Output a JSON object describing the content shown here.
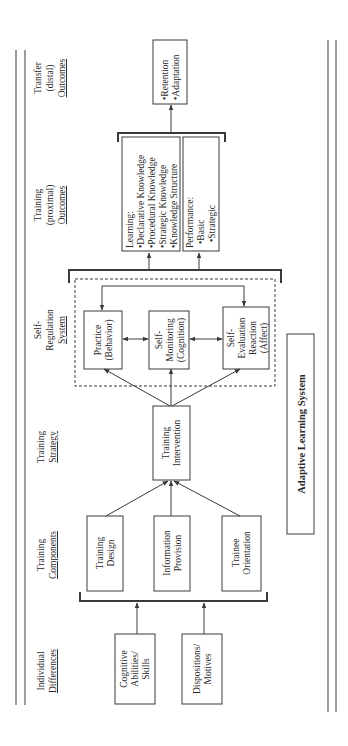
{
  "title": "Adaptive Learning System",
  "columns": {
    "individual_differences": [
      "Individual",
      "Differences"
    ],
    "training_components": [
      "Training",
      "Components"
    ],
    "training_strategy": [
      "Training",
      "Strategy"
    ],
    "self_regulation_system": [
      "Self-",
      "Regulation",
      "System"
    ],
    "training_proximal_outcomes": [
      "Training",
      "(proximal)",
      "Outcomes"
    ],
    "transfer_distal_outcomes": [
      "Transfer",
      "(distal)",
      "Outcomes"
    ]
  },
  "individual_differences": {
    "cognitive": [
      "Cognitive",
      "Abilities/",
      "Skills"
    ],
    "dispositions": [
      "Dispositions/",
      "Motives"
    ]
  },
  "training_components": {
    "design": [
      "Training",
      "Design"
    ],
    "information": [
      "Information",
      "Provision"
    ],
    "orientation": [
      "Trainee",
      "Orientation"
    ]
  },
  "training_strategy": {
    "intervention": [
      "Training",
      "Intervention"
    ]
  },
  "self_regulation": {
    "practice": [
      "Practice",
      "(Behavior)"
    ],
    "monitoring": [
      "Self-",
      "Monitoring",
      "(Cognition)"
    ],
    "evaluation": [
      "Self-",
      "Evaluation",
      "Reaction",
      "(Affect)"
    ]
  },
  "proximal_outcomes": {
    "learning": [
      "Learning:",
      "•Declarative Knowledge",
      "•Procedural Knowledge",
      "•Strategic Knowledge",
      "•Knowledge Structure"
    ],
    "performance": [
      "Performance:",
      "•Basic",
      "•Strategic"
    ]
  },
  "distal_outcomes": {
    "transfer": [
      "•Retention",
      "•Adaptation"
    ]
  }
}
